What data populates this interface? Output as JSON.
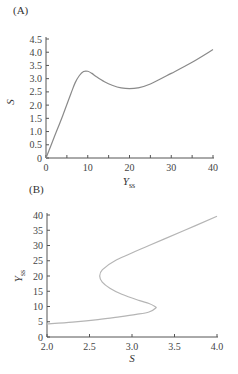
{
  "chart_data": [
    {
      "panel": "(A)",
      "type": "line",
      "title": "",
      "xlabel": "Y_ss",
      "ylabel": "S",
      "xlim": [
        0,
        40
      ],
      "ylim": [
        0,
        4.5
      ],
      "xticks": [
        0,
        10,
        20,
        30,
        40
      ],
      "yticks": [
        0,
        0.5,
        1.0,
        1.5,
        2.0,
        2.5,
        3.0,
        3.5,
        4.0,
        4.5
      ],
      "ytick_labels": [
        "0",
        "0.5",
        "1.0",
        "1.5",
        "2.0",
        "2.5",
        "3.0",
        "3.5",
        "4.0",
        "4.5"
      ],
      "grid": false,
      "series": [
        {
          "name": "S vs Yss",
          "color": "#8a8a8a",
          "x": [
            0,
            2,
            4,
            6,
            7,
            8,
            9,
            10,
            11,
            12,
            14,
            16,
            18,
            20,
            22,
            25,
            30,
            35,
            40
          ],
          "y": [
            0,
            0.8,
            1.6,
            2.45,
            2.85,
            3.12,
            3.27,
            3.28,
            3.2,
            3.08,
            2.88,
            2.74,
            2.65,
            2.62,
            2.65,
            2.8,
            3.2,
            3.62,
            4.1
          ]
        }
      ]
    },
    {
      "panel": "(B)",
      "type": "line",
      "title": "",
      "xlabel": "S",
      "ylabel": "Y_ss",
      "xlim": [
        2.0,
        4.0
      ],
      "ylim": [
        0,
        40
      ],
      "xticks": [
        2.0,
        2.5,
        3.0,
        3.5,
        4.0
      ],
      "xtick_labels": [
        "2.0",
        "2.5",
        "3.0",
        "3.5",
        "4.0"
      ],
      "yticks": [
        0,
        5,
        10,
        15,
        20,
        25,
        30,
        35,
        40
      ],
      "grid": false,
      "series": [
        {
          "name": "Yss vs S",
          "color": "#b5b5b5",
          "x": [
            2.0,
            2.3,
            2.6,
            2.85,
            3.05,
            3.2,
            3.28,
            3.27,
            3.2,
            3.08,
            2.88,
            2.74,
            2.65,
            2.62,
            2.65,
            2.8,
            3.2,
            3.62,
            4.0
          ],
          "y": [
            4.3,
            4.9,
            5.7,
            6.6,
            7.4,
            8.2,
            9.5,
            10.0,
            11.0,
            12.0,
            14.0,
            16.0,
            18.0,
            20.0,
            22.0,
            25.0,
            30.0,
            35.0,
            39.6
          ]
        }
      ]
    }
  ],
  "labels": {
    "panel_a": "(A)",
    "panel_b": "(B)",
    "a_ylabel": "S",
    "a_xlabel_main": "Y",
    "a_xlabel_sub": "ss",
    "b_ylabel_main": "Y",
    "b_ylabel_sub": "ss",
    "b_xlabel": "S"
  }
}
